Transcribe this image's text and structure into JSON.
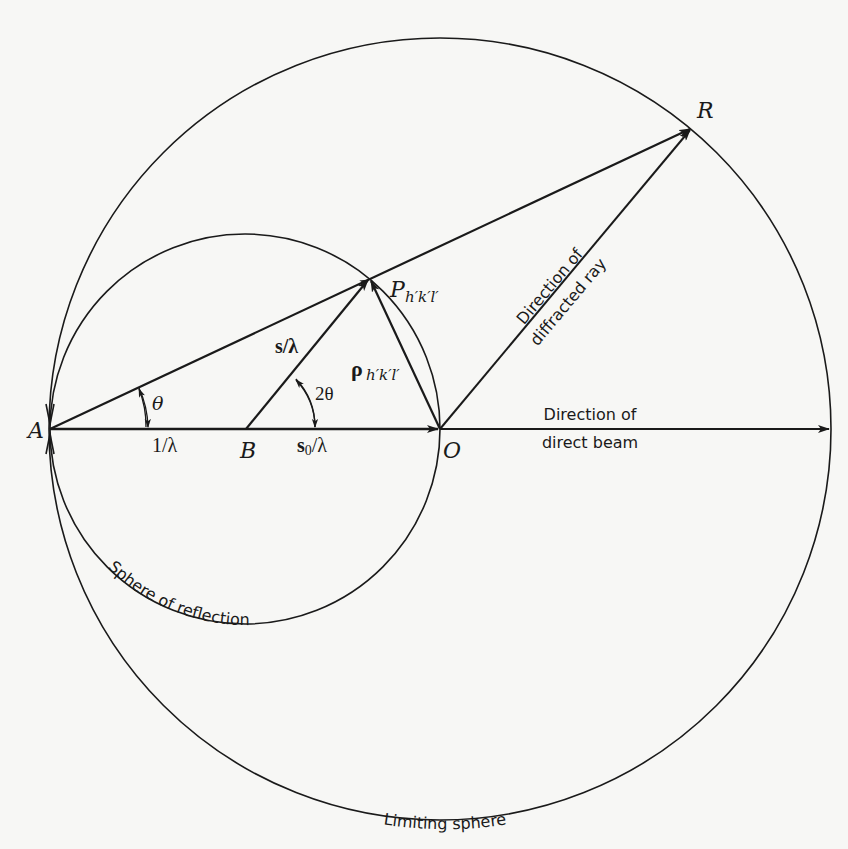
{
  "figure": {
    "points": {
      "A": "A",
      "B": "B",
      "O": "O",
      "R": "R",
      "P": "P",
      "P_sub": "h′k′l′"
    },
    "vectors": {
      "incident": "1/λ",
      "s": "s/λ",
      "s0": "s",
      "s0_sub": "0",
      "s0_suffix": "/λ",
      "rho": "ρ",
      "rho_sub": "h′k′l′"
    },
    "angles": {
      "theta": "θ",
      "two_theta": "2θ"
    },
    "labels": {
      "direct_beam_line1": "Direction of",
      "direct_beam_line2": "direct beam",
      "diffracted_line1": "Direction of",
      "diffracted_line2": "diffracted ray",
      "sphere_of_reflection": "Sphere of reflection",
      "limiting_sphere": "Limiting sphere"
    },
    "colors": {
      "ink": "#1a1a1a",
      "paper": "#f7f7f5"
    }
  }
}
